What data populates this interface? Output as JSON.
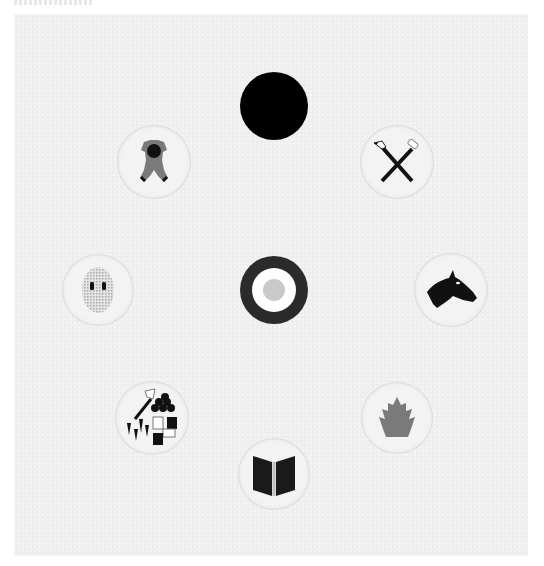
{
  "board": {
    "background_color": "#efefef",
    "margin_color": "#ffffff"
  },
  "tokens": [
    {
      "id": "top",
      "icon": "black-circle-icon",
      "center": [
        274,
        106
      ],
      "diameter": 70,
      "color": "#000000"
    },
    {
      "id": "upper-left",
      "icon": "doll-figure-icon",
      "center": [
        154,
        162
      ],
      "diameter": 72,
      "color": "#777777"
    },
    {
      "id": "upper-right",
      "icon": "crossed-tools-icon",
      "center": [
        397,
        162
      ],
      "diameter": 72,
      "color": "#111111"
    },
    {
      "id": "middle-left",
      "icon": "mask-icon",
      "center": [
        98,
        290
      ],
      "diameter": 70,
      "color": "#cfcfcf"
    },
    {
      "id": "center",
      "icon": "target-roundel-icon",
      "center": [
        274,
        290
      ],
      "diameter": 70,
      "colors": [
        "#2b2b2b",
        "#ffffff",
        "#c9c9c9"
      ]
    },
    {
      "id": "middle-right",
      "icon": "horse-head-icon",
      "center": [
        451,
        290
      ],
      "diameter": 72,
      "color": "#111111"
    },
    {
      "id": "lower-left",
      "icon": "resources-icon",
      "center": [
        152,
        418
      ],
      "diameter": 72,
      "color": "#111111"
    },
    {
      "id": "lower-right",
      "icon": "fire-icon",
      "center": [
        397,
        418
      ],
      "diameter": 70,
      "color": "#7a7a7a"
    },
    {
      "id": "bottom",
      "icon": "book-icon",
      "center": [
        274,
        474
      ],
      "diameter": 70,
      "color": "#1a1a1a"
    }
  ]
}
